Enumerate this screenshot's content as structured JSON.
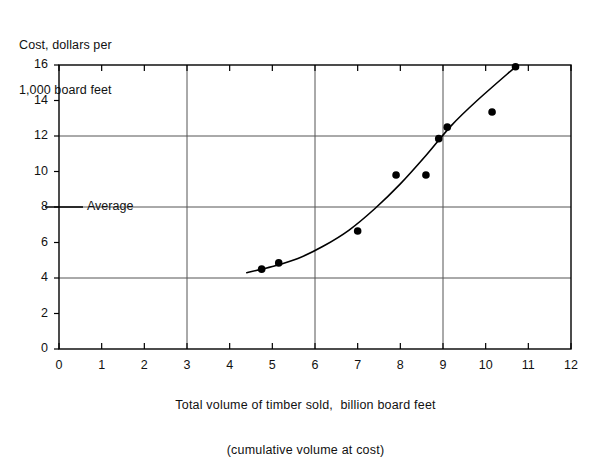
{
  "chart_data": {
    "type": "scatter",
    "title": "",
    "ylabel_line1": "Cost, dollars per",
    "ylabel_line2": "1,000 board feet",
    "xlabel_line1": "Total volume of timber sold,  billion board feet",
    "xlabel_line2": "(cumulative volume at cost)",
    "xlim": [
      0,
      12
    ],
    "ylim": [
      0,
      16
    ],
    "xticks": [
      0,
      1,
      2,
      3,
      4,
      5,
      6,
      7,
      8,
      9,
      10,
      11,
      12
    ],
    "yticks": [
      0,
      2,
      4,
      6,
      8,
      10,
      12,
      14,
      16
    ],
    "xtick_labels": [
      "0",
      "1",
      "2",
      "3",
      "4",
      "5",
      "6",
      "7",
      "8",
      "9",
      "10",
      "11",
      "12"
    ],
    "ytick_labels": [
      "0",
      "2",
      "4",
      "6",
      "8",
      "10",
      "12",
      "14",
      "16"
    ],
    "grid_x": [
      3,
      6,
      9
    ],
    "grid_y": [
      4,
      12
    ],
    "grid": true,
    "legend_position": "inline-left",
    "annotations": [
      {
        "name": "average",
        "label": "Average",
        "y_value": 8,
        "style": "horizontal-line-full-width"
      }
    ],
    "points": [
      {
        "x": 4.75,
        "y": 4.5
      },
      {
        "x": 5.15,
        "y": 4.85
      },
      {
        "x": 7.0,
        "y": 6.65
      },
      {
        "x": 7.9,
        "y": 9.8
      },
      {
        "x": 8.6,
        "y": 9.8
      },
      {
        "x": 8.9,
        "y": 11.85
      },
      {
        "x": 9.1,
        "y": 12.5
      },
      {
        "x": 10.15,
        "y": 13.35
      },
      {
        "x": 10.7,
        "y": 15.9
      }
    ],
    "fit_curve": [
      {
        "x": 4.4,
        "y": 4.3
      },
      {
        "x": 5.0,
        "y": 4.65
      },
      {
        "x": 5.6,
        "y": 5.1
      },
      {
        "x": 6.2,
        "y": 5.8
      },
      {
        "x": 6.8,
        "y": 6.7
      },
      {
        "x": 7.4,
        "y": 7.9
      },
      {
        "x": 8.0,
        "y": 9.3
      },
      {
        "x": 8.6,
        "y": 10.9
      },
      {
        "x": 9.2,
        "y": 12.6
      },
      {
        "x": 9.8,
        "y": 14.0
      },
      {
        "x": 10.7,
        "y": 15.9
      }
    ],
    "colors": {
      "axis": "#000000",
      "grid": "#555555",
      "point": "#000000",
      "curve": "#000000",
      "average_line": "#555555"
    }
  }
}
